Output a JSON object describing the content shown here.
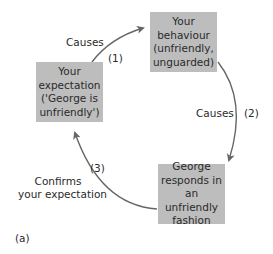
{
  "diagram": {
    "nodes": [
      {
        "id": "expectation",
        "lines": [
          "Your",
          "expectation",
          "('George is",
          "unfriendly')"
        ]
      },
      {
        "id": "behaviour",
        "lines": [
          "Your",
          "behaviour",
          "(unfriendly,",
          "unguarded)"
        ]
      },
      {
        "id": "response",
        "lines": [
          "George",
          "responds in",
          "an unfriendly",
          "fashion"
        ]
      }
    ],
    "edges": [
      {
        "from": "expectation",
        "to": "behaviour",
        "label": "Causes",
        "number": "(1)"
      },
      {
        "from": "behaviour",
        "to": "response",
        "label": "Causes",
        "number": "(2)"
      },
      {
        "from": "response",
        "to": "expectation",
        "label_lines": [
          "Confirms",
          "your expectation"
        ],
        "number": "(3)"
      }
    ],
    "panel_label": "(a)",
    "colors": {
      "box_fill": "#bdbdbd",
      "arrow": "#666666",
      "text": "#2a2a2a"
    }
  }
}
